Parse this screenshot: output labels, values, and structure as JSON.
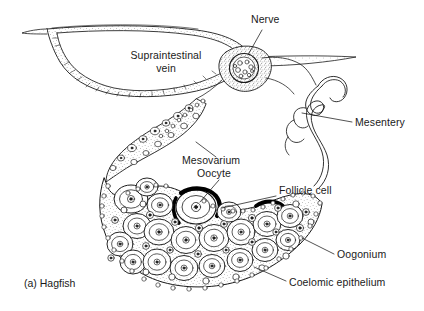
{
  "figure": {
    "caption": "(a) Hagfish",
    "background_color": "#ffffff",
    "ink_color": "#1a1a1a"
  },
  "labels": {
    "nerve": "Nerve",
    "supraintestinal_vein_line1": "Supraintestinal",
    "supraintestinal_vein_line2": "vein",
    "mesentery": "Mesentery",
    "mesovarium": "Mesovarium",
    "oocyte": "Oocyte",
    "follicle_cell": "Follicle cell",
    "oogonium": "Oogonium",
    "coelomic_epithelium": "Coelomic epithelium"
  },
  "structures": [
    {
      "name": "supraintestinal-vein",
      "description": "large lens-shaped vessel lumen with stippled double wall"
    },
    {
      "name": "nerve",
      "description": "dark stippled circular nerve cross-section"
    },
    {
      "name": "mesentery",
      "description": "folded wavy double-line membrane ribbon"
    },
    {
      "name": "mesovarium",
      "description": "stippled suspensory band bearing small cells"
    },
    {
      "name": "ovary",
      "description": "crescent-shaped mass of oocytes and oogonia"
    },
    {
      "name": "follicle-cell",
      "description": "thick black crescent arcs around oocytes"
    },
    {
      "name": "coelomic-epithelium",
      "description": "beaded cell layer along ovary surface"
    }
  ]
}
